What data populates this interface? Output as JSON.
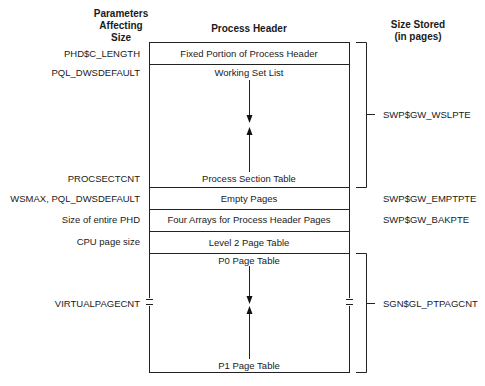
{
  "headers": {
    "left": "Parameters Affecting Size",
    "left_lines": [
      "Parameters",
      "Affecting",
      "Size"
    ],
    "center": "Process Header",
    "right_lines": [
      "Size Stored",
      "(in pages)"
    ]
  },
  "regions": [
    {
      "name": "Fixed Portion of Process Header",
      "parameter": "PHD$C_LENGTH"
    },
    {
      "name": "Working Set List",
      "parameter": "PQL_DWSDEFAULT"
    },
    {
      "name": "Process Section Table",
      "parameter": "PROCSECTCNT"
    },
    {
      "name": "Empty Pages",
      "parameter": "WSMAX, PQL_DWSDEFAULT",
      "stored": "SWP$GW_EMPTPTE"
    },
    {
      "name": "Four Arrays for Process Header Pages",
      "parameter": "Size of entire PHD",
      "stored": "SWP$GW_BAKPTE"
    },
    {
      "name": "Level 2 Page Table",
      "parameter": "CPU page size"
    },
    {
      "name": "P0 Page Table",
      "parameter": "VIRTUALPAGECNT"
    },
    {
      "name": "P1 Page Table"
    }
  ],
  "brackets": [
    {
      "label": "SWP$GW_WSLPTE",
      "spans": [
        "Fixed Portion of Process Header",
        "Working Set List",
        "Process Section Table"
      ]
    },
    {
      "label": "SGN$GL_PTPAGCNT",
      "spans": [
        "P0 Page Table",
        "P1 Page Table"
      ]
    }
  ]
}
